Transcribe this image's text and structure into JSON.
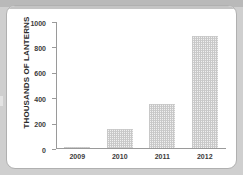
{
  "chart_data": {
    "type": "bar",
    "title": "",
    "xlabel": "",
    "ylabel": "THOUSANDS OF LANTERNS",
    "categories": [
      "2009",
      "2010",
      "2011",
      "2012"
    ],
    "values": [
      5,
      150,
      345,
      880
    ],
    "ylim": [
      0,
      1000
    ],
    "yticks": [
      0,
      200,
      400,
      600,
      800,
      1000
    ],
    "ytick_labels": [
      "0",
      "200",
      "400",
      "600",
      "800",
      "1000"
    ],
    "grid": false,
    "legend": false,
    "legend_position": "none",
    "bar_fill": "#f0f0f0",
    "bar_pattern": "fine-crosshatch",
    "axis_color": "#9a9a9a"
  },
  "figure": {
    "background": "#ffffff",
    "page_background": "#cfcfcf"
  }
}
